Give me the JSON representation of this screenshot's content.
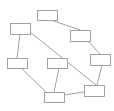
{
  "diagram": {
    "type": "graph",
    "width": 114,
    "height": 111,
    "background": "#ffffff",
    "node_stroke": "#9a9a9a",
    "edge_stroke": "#8a8a8a",
    "nodes": [
      {
        "id": "A",
        "x": 37,
        "y": 10,
        "w": 20,
        "h": 10,
        "label": ""
      },
      {
        "id": "B",
        "x": 10,
        "y": 23,
        "w": 20,
        "h": 11,
        "label": ""
      },
      {
        "id": "C",
        "x": 70,
        "y": 30,
        "w": 20,
        "h": 11,
        "label": ""
      },
      {
        "id": "D",
        "x": 7,
        "y": 58,
        "w": 20,
        "h": 10,
        "label": ""
      },
      {
        "id": "E",
        "x": 47,
        "y": 58,
        "w": 20,
        "h": 10,
        "label": ""
      },
      {
        "id": "F",
        "x": 90,
        "y": 54,
        "w": 20,
        "h": 11,
        "label": ""
      },
      {
        "id": "G",
        "x": 44,
        "y": 92,
        "w": 20,
        "h": 10,
        "label": ""
      },
      {
        "id": "H",
        "x": 84,
        "y": 85,
        "w": 20,
        "h": 11,
        "label": ""
      }
    ],
    "edges": [
      {
        "from": "A",
        "to": "C",
        "x1": 51,
        "y1": 20,
        "x2": 80,
        "y2": 30
      },
      {
        "from": "B",
        "to": "D",
        "x1": 20,
        "y1": 34,
        "x2": 17,
        "y2": 58
      },
      {
        "from": "B",
        "to": "H",
        "x1": 30,
        "y1": 32,
        "x2": 96,
        "y2": 85
      },
      {
        "from": "C",
        "to": "F",
        "x1": 88,
        "y1": 41,
        "x2": 100,
        "y2": 54
      },
      {
        "from": "D",
        "to": "G",
        "x1": 21,
        "y1": 68,
        "x2": 46,
        "y2": 92
      },
      {
        "from": "E",
        "to": "G",
        "x1": 59,
        "y1": 68,
        "x2": 54,
        "y2": 92
      },
      {
        "from": "F",
        "to": "H",
        "x1": 102,
        "y1": 65,
        "x2": 97,
        "y2": 85
      },
      {
        "from": "G",
        "to": "H",
        "x1": 64,
        "y1": 95,
        "x2": 84,
        "y2": 92
      }
    ]
  }
}
